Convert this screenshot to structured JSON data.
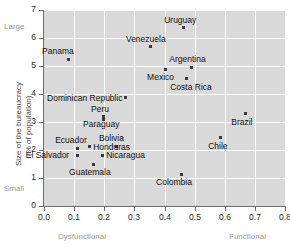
{
  "chart_data": {
    "type": "scatter",
    "title": "",
    "xlabel": "Dysfunctional",
    "xlabel_right": "Functional",
    "ylabel": "Size of the bureaucracy\n(% of population)",
    "ylabel_line1": "Size of the bureaucracy",
    "ylabel_line2": "(% of population)",
    "y_top_note": "Large",
    "y_bottom_note": "Small",
    "xlim": [
      0.0,
      0.8
    ],
    "ylim": [
      0,
      7
    ],
    "xticks": [
      "0.0",
      "0.1",
      "0.2",
      "0.3",
      "0.4",
      "0.5",
      "0.6",
      "0.7",
      "0.8"
    ],
    "xtick_values": [
      0.0,
      0.1,
      0.2,
      0.3,
      0.4,
      0.5,
      0.6,
      0.7,
      0.8
    ],
    "yticks": [
      "0",
      "1",
      "2",
      "3",
      "4",
      "5",
      "6",
      "7"
    ],
    "ytick_values": [
      0,
      1,
      2,
      3,
      4,
      5,
      6,
      7
    ],
    "grid": true,
    "legend": "none",
    "panel_color": "#d9d9d9",
    "grid_color": "#ffffff",
    "point_color": "#3a3a3a",
    "points": [
      {
        "name": "Panama",
        "x": 0.08,
        "y": 5.25,
        "lx": -26,
        "ly": -12
      },
      {
        "name": "Venezuela",
        "x": 0.355,
        "y": 5.68,
        "lx": -25,
        "ly": -12
      },
      {
        "name": "Uruguay",
        "x": 0.462,
        "y": 6.36,
        "lx": -19,
        "ly": -12
      },
      {
        "name": "Argentina",
        "x": 0.489,
        "y": 4.96,
        "lx": -22,
        "ly": -12
      },
      {
        "name": "Mexico",
        "x": 0.402,
        "y": 4.89,
        "lx": -18,
        "ly": 4
      },
      {
        "name": "Costa Rica",
        "x": 0.472,
        "y": 4.54,
        "lx": -16,
        "ly": 4
      },
      {
        "name": "Dominican Republic",
        "x": 0.269,
        "y": 3.86,
        "lx": -78,
        "ly": -4
      },
      {
        "name": "Peru",
        "x": 0.196,
        "y": 3.18,
        "lx": -12,
        "ly": -12
      },
      {
        "name": "Paraguay",
        "x": 0.196,
        "y": 3.1,
        "lx": -20,
        "ly": 1
      },
      {
        "name": "Brazil",
        "x": 0.668,
        "y": 3.29,
        "lx": -14,
        "ly": 4
      },
      {
        "name": "Chile",
        "x": 0.585,
        "y": 2.43,
        "lx": -12,
        "ly": 4
      },
      {
        "name": "Ecuador",
        "x": 0.11,
        "y": 2.07,
        "lx": -22,
        "ly": -12
      },
      {
        "name": "Bolivia",
        "x": 0.242,
        "y": 2.14,
        "lx": -18,
        "ly": -12
      },
      {
        "name": "Honduras",
        "x": 0.15,
        "y": 2.11,
        "lx": 4,
        "ly": -4
      },
      {
        "name": "El Salvador",
        "x": 0.112,
        "y": 1.82,
        "lx": -52,
        "ly": -4
      },
      {
        "name": "Nicaragua",
        "x": 0.193,
        "y": 1.82,
        "lx": 4,
        "ly": -4
      },
      {
        "name": "Guatemala",
        "x": 0.163,
        "y": 1.5,
        "lx": -24,
        "ly": 4
      },
      {
        "name": "Colombia",
        "x": 0.455,
        "y": 1.14,
        "lx": -25,
        "ly": 4
      }
    ]
  },
  "layout": {
    "plot_left": 44,
    "plot_right": 285,
    "plot_top": 10,
    "plot_bottom": 206
  }
}
